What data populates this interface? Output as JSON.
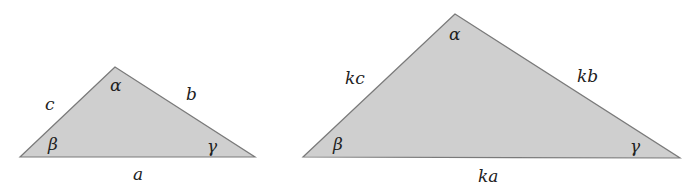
{
  "diagram": {
    "fill_color": "#cfcfcf",
    "stroke_color": "#7a7a7a",
    "small_triangle": {
      "vertices": {
        "top": [
          115,
          67
        ],
        "left": [
          20,
          157
        ],
        "right": [
          255,
          157
        ]
      },
      "angles": {
        "top": "α",
        "left": "β",
        "right": "γ"
      },
      "sides": {
        "bottom": "a",
        "right": "b",
        "left": "c"
      }
    },
    "large_triangle": {
      "vertices": {
        "top": [
          455,
          14
        ],
        "left": [
          303,
          157
        ],
        "right": [
          680,
          158
        ]
      },
      "angles": {
        "top": "α",
        "left": "β",
        "right": "γ"
      },
      "sides": {
        "bottom": "ka",
        "right": "kb",
        "left": "kc"
      }
    }
  }
}
